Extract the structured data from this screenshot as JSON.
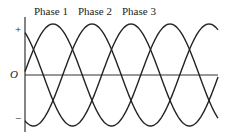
{
  "labels": {
    "phase1": "Phase 1",
    "phase2": "Phase 2",
    "phase3": "Phase 3",
    "plus": "+",
    "minus": "−",
    "origin": "O"
  },
  "chart_data": {
    "type": "line",
    "series": [
      {
        "name": "Phase 1",
        "phase_offset_deg": 0
      },
      {
        "name": "Phase 2",
        "phase_offset_deg": 120
      },
      {
        "name": "Phase 3",
        "phase_offset_deg": 240
      }
    ],
    "xlabel": "",
    "ylabel": "",
    "y_ticks": [
      "+",
      "O",
      "−"
    ],
    "periods_shown": 2
  },
  "colors": {
    "line": "#222222"
  }
}
